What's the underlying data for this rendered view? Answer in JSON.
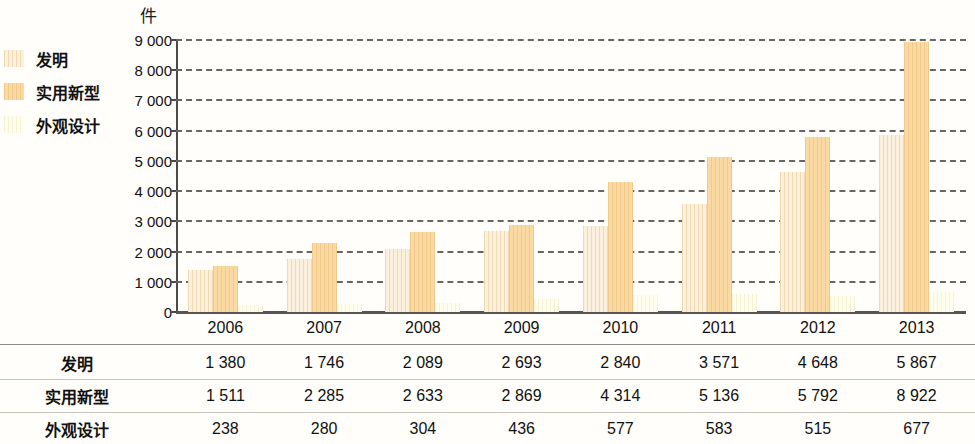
{
  "chart_data": {
    "type": "bar",
    "title": "",
    "subtitle": "",
    "unit_label": "件",
    "xlabel": "",
    "ylabel": "件",
    "grid": true,
    "legend_position": "left",
    "ylim": [
      0,
      9000
    ],
    "ytick_step": 1000,
    "ytick_labels": [
      "9 000",
      "8 000",
      "7 000",
      "6 000",
      "5 000",
      "4 000",
      "3 000",
      "2 000",
      "1 000",
      "0"
    ],
    "ytick_values": [
      9000,
      8000,
      7000,
      6000,
      5000,
      4000,
      3000,
      2000,
      1000,
      0
    ],
    "categories": [
      "2006",
      "2007",
      "2008",
      "2009",
      "2010",
      "2011",
      "2012",
      "2013"
    ],
    "series": [
      {
        "name": "发明",
        "color": "#fbf0dd",
        "values": [
          1380,
          1746,
          2089,
          2693,
          2840,
          3571,
          4648,
          5867
        ],
        "labels": [
          "1 380",
          "1 746",
          "2 089",
          "2 693",
          "2 840",
          "3 571",
          "4 648",
          "5 867"
        ]
      },
      {
        "name": "实用新型",
        "color": "#fbd9a2",
        "values": [
          1511,
          2285,
          2633,
          2869,
          4314,
          5136,
          5792,
          8922
        ],
        "labels": [
          "1 511",
          "2 285",
          "2 633",
          "2 869",
          "4 314",
          "5 136",
          "5 792",
          "8 922"
        ]
      },
      {
        "name": "外观设计",
        "color": "#fefdee",
        "values": [
          238,
          280,
          304,
          436,
          577,
          583,
          515,
          677
        ],
        "labels": [
          "238",
          "280",
          "304",
          "436",
          "577",
          "583",
          "515",
          "677"
        ]
      }
    ]
  },
  "legend": {
    "items": [
      {
        "label": "发明",
        "color": "#fbf0dd"
      },
      {
        "label": "实用新型",
        "color": "#fbd9a2"
      },
      {
        "label": "外观设计",
        "color": "#fefdee"
      }
    ]
  },
  "table": {
    "header": [
      "2006",
      "2007",
      "2008",
      "2009",
      "2010",
      "2011",
      "2012",
      "2013"
    ],
    "rows": [
      {
        "label": "发明",
        "cells": [
          "1 380",
          "1 746",
          "2 089",
          "2 693",
          "2 840",
          "3 571",
          "4 648",
          "5 867"
        ]
      },
      {
        "label": "实用新型",
        "cells": [
          "1 511",
          "2 285",
          "2 633",
          "2 869",
          "4 314",
          "5 136",
          "5 792",
          "8 922"
        ]
      },
      {
        "label": "外观设计",
        "cells": [
          "238",
          "280",
          "304",
          "436",
          "577",
          "583",
          "515",
          "677"
        ]
      }
    ]
  }
}
